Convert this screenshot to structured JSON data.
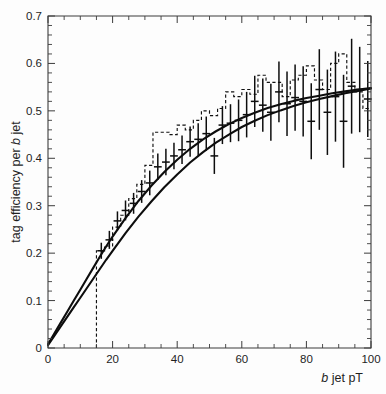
{
  "chart_data": {
    "type": "line",
    "title": "",
    "subtitle": "",
    "xlabel": "b jet pT",
    "xlabel_italic_prefix": "b",
    "xlabel_rest": " jet pT",
    "ylabel": "tag efficiency per b jet",
    "ylabel_prefix": "tag efficiency per ",
    "ylabel_italic": "b",
    "ylabel_suffix": " jet",
    "xlim": [
      0,
      100
    ],
    "ylim": [
      0,
      0.7
    ],
    "grid": false,
    "legend": "none",
    "x_major_ticks": [
      0,
      20,
      40,
      60,
      80,
      100
    ],
    "x_major_tick_labels": [
      "0",
      "20",
      "40",
      "60",
      "80",
      "100"
    ],
    "x_minor_step": 5,
    "y_major_ticks": [
      0,
      0.1,
      0.2,
      0.3,
      0.4,
      0.5,
      0.6,
      0.7
    ],
    "y_major_tick_labels": [
      "0",
      "0.1",
      "0.2",
      "0.3",
      "0.4",
      "0.5",
      "0.6",
      "0.7"
    ],
    "y_minor_step": 0.02,
    "series": [
      {
        "name": "fit-curve-upper",
        "style": "solid-line",
        "color": "#0d0d0d",
        "x": [
          0,
          2,
          4,
          6,
          8,
          10,
          12,
          14,
          16,
          18,
          20,
          24,
          28,
          32,
          36,
          40,
          44,
          48,
          52,
          56,
          60,
          64,
          68,
          72,
          76,
          80,
          84,
          88,
          92,
          96,
          100
        ],
        "y": [
          0.008,
          0.031,
          0.054,
          0.077,
          0.1,
          0.123,
          0.146,
          0.169,
          0.192,
          0.214,
          0.235,
          0.274,
          0.31,
          0.342,
          0.371,
          0.397,
          0.42,
          0.44,
          0.457,
          0.472,
          0.485,
          0.496,
          0.506,
          0.514,
          0.521,
          0.527,
          0.532,
          0.537,
          0.541,
          0.545,
          0.548
        ]
      },
      {
        "name": "fit-curve-lower",
        "style": "solid-line",
        "color": "#0d0d0d",
        "x": [
          0,
          2,
          4,
          6,
          8,
          10,
          12,
          14,
          16,
          18,
          20,
          24,
          28,
          32,
          36,
          40,
          44,
          48,
          52,
          56,
          60,
          64,
          68,
          72,
          76,
          80,
          84,
          88,
          92,
          96,
          100
        ],
        "y": [
          0.006,
          0.026,
          0.046,
          0.066,
          0.086,
          0.106,
          0.126,
          0.146,
          0.166,
          0.186,
          0.205,
          0.242,
          0.277,
          0.309,
          0.339,
          0.366,
          0.391,
          0.413,
          0.433,
          0.45,
          0.466,
          0.479,
          0.491,
          0.501,
          0.51,
          0.518,
          0.525,
          0.531,
          0.537,
          0.542,
          0.547
        ]
      }
    ],
    "histogram": {
      "name": "mc-histogram",
      "style": "dashed-step",
      "color": "#111111",
      "bin_edges": [
        15,
        17.5,
        20,
        22.5,
        25,
        27.5,
        30,
        32.5,
        35,
        37.5,
        40,
        42.5,
        45,
        47.5,
        50,
        52.5,
        55,
        57.5,
        60,
        62.5,
        65,
        67.5,
        70,
        72.5,
        75,
        77.5,
        80,
        82.5,
        85,
        87.5,
        90,
        92.5,
        95,
        97.5,
        100
      ],
      "bin_values": [
        0.205,
        0.215,
        0.255,
        0.28,
        0.315,
        0.345,
        0.385,
        0.455,
        0.455,
        0.45,
        0.47,
        0.46,
        0.48,
        0.5,
        0.49,
        0.505,
        0.54,
        0.53,
        0.545,
        0.535,
        0.575,
        0.56,
        0.56,
        0.53,
        0.565,
        0.575,
        0.595,
        0.565,
        0.545,
        0.6,
        0.62,
        0.56,
        0.54,
        0.505
      ],
      "start_floor": 0.0
    },
    "points": {
      "name": "data-points-with-errors",
      "marker": "cross",
      "color": "#0d0d0d",
      "x": [
        16.5,
        19,
        21.5,
        24,
        26.5,
        29,
        31.5,
        34,
        36.5,
        39,
        41.5,
        44,
        46.5,
        49,
        51.5,
        54,
        56.5,
        59,
        61.5,
        64,
        66.5,
        69,
        71.5,
        74,
        76.5,
        79,
        81.5,
        84,
        86.5,
        89,
        91.5,
        94,
        96.5,
        99
      ],
      "y": [
        0.205,
        0.228,
        0.268,
        0.29,
        0.305,
        0.33,
        0.348,
        0.382,
        0.392,
        0.405,
        0.418,
        0.435,
        0.44,
        0.452,
        0.405,
        0.47,
        0.474,
        0.48,
        0.492,
        0.52,
        0.512,
        0.497,
        0.54,
        0.515,
        0.528,
        0.52,
        0.478,
        0.545,
        0.497,
        0.53,
        0.478,
        0.552,
        0.545,
        0.525
      ],
      "yerr": [
        0.017,
        0.019,
        0.02,
        0.021,
        0.022,
        0.024,
        0.026,
        0.028,
        0.028,
        0.028,
        0.03,
        0.032,
        0.034,
        0.036,
        0.038,
        0.04,
        0.04,
        0.044,
        0.048,
        0.054,
        0.056,
        0.06,
        0.064,
        0.068,
        0.07,
        0.074,
        0.08,
        0.085,
        0.09,
        0.095,
        0.098,
        0.1,
        0.09,
        0.08
      ],
      "xerr": [
        1.2,
        1.2,
        1.2,
        1.2,
        1.2,
        1.2,
        1.2,
        1.2,
        1.2,
        1.2,
        1.2,
        1.2,
        1.2,
        1.2,
        1.2,
        1.2,
        1.2,
        1.2,
        1.2,
        1.2,
        1.2,
        1.2,
        1.2,
        1.2,
        1.2,
        1.2,
        1.2,
        1.2,
        1.2,
        1.2,
        1.2,
        1.2,
        1.2,
        1.2
      ]
    }
  }
}
